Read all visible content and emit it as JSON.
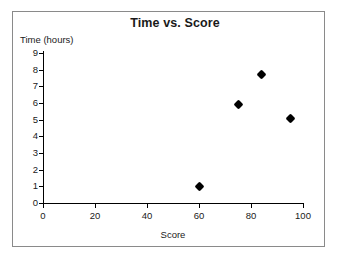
{
  "chart_data": {
    "type": "scatter",
    "title": "Time vs. Score",
    "xlabel": "Score",
    "ylabel": "Time (hours)",
    "xlim": [
      0,
      100
    ],
    "ylim": [
      0,
      9
    ],
    "xticks": [
      0,
      20,
      40,
      60,
      80,
      100
    ],
    "yticks": [
      0,
      1,
      2,
      3,
      4,
      5,
      6,
      7,
      8,
      9
    ],
    "grid": false,
    "legend": false,
    "marker": "diamond",
    "marker_color": "#000000",
    "points": [
      {
        "x": 60,
        "y": 1.0
      },
      {
        "x": 75,
        "y": 5.9
      },
      {
        "x": 84,
        "y": 7.7
      },
      {
        "x": 95,
        "y": 5.1
      }
    ]
  },
  "figure": {
    "background_color": "#ffffff",
    "frame_color": "#8a8a8a",
    "axis_color": "#000000",
    "text_color": "#1a1a1a"
  }
}
